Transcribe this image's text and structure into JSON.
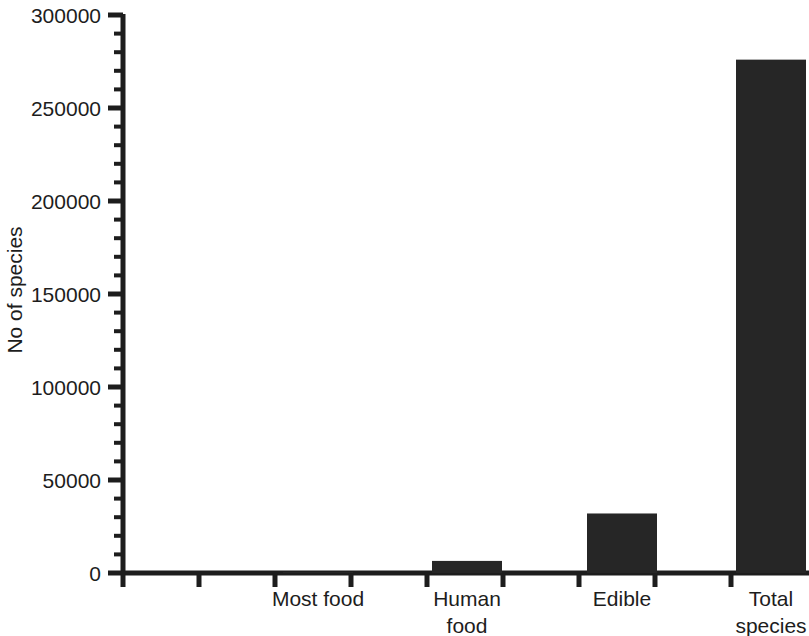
{
  "chart_data": {
    "type": "bar",
    "title": "",
    "subtitle": "",
    "xlabel": "",
    "ylabel": "No of species",
    "categories": [
      "Most food",
      "Human food",
      "Edible",
      "Total species"
    ],
    "category_lines": [
      [
        "Most food"
      ],
      [
        "Human",
        "food"
      ],
      [
        "Edible"
      ],
      [
        "Total",
        "species"
      ]
    ],
    "values": [
      500,
      6500,
      32000,
      276000
    ],
    "ylim": [
      0,
      300000
    ],
    "ytick_labels": [
      "0",
      "50000",
      "100000",
      "150000",
      "200000",
      "250000",
      "300000"
    ],
    "ytick_values": [
      0,
      50000,
      100000,
      150000,
      200000,
      250000,
      300000
    ],
    "minor_tick_step": 10000,
    "grid": false,
    "legend": false,
    "legend_position": "none",
    "bar_color": "#262626",
    "axis_color": "#1d1d1d"
  },
  "axis": {
    "y_title": "No of species"
  }
}
